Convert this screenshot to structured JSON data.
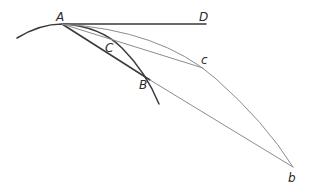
{
  "figure": {
    "type": "geometric-construction",
    "labels": {
      "A": "A",
      "D": "D",
      "C": "C",
      "c": "c",
      "B": "B",
      "b": "b"
    },
    "points": {
      "A": [
        62,
        24
      ],
      "D": [
        206,
        24
      ],
      "C": [
        118,
        46
      ],
      "c": [
        203,
        68
      ],
      "B": [
        150,
        80
      ],
      "b": [
        293,
        167
      ]
    },
    "elements": [
      {
        "id": "small-arc",
        "desc": "Small circle arc through A, C, B",
        "style": "thick"
      },
      {
        "id": "tangent-AD",
        "desc": "Tangent line A to D",
        "style": "thick"
      },
      {
        "id": "chord-AB",
        "desc": "Chord A to B",
        "style": "thick"
      },
      {
        "id": "large-arc",
        "desc": "Large arc through A, c, b",
        "style": "thin"
      },
      {
        "id": "chord-Ac",
        "desc": "Chord A to c",
        "style": "thin"
      },
      {
        "id": "line-Bb",
        "desc": "Line B to b",
        "style": "thin"
      }
    ],
    "colors": {
      "thick_stroke": "#3a3a3a",
      "thin_stroke": "#8c8c8c",
      "label": "#2b2b2b",
      "background": "#ffffff"
    }
  }
}
